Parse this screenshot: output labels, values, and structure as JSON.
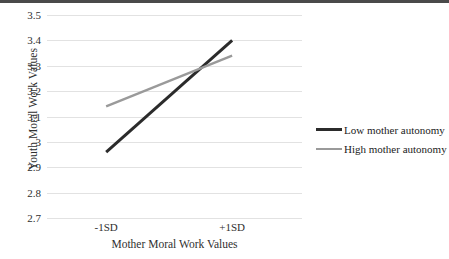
{
  "chart_data": {
    "type": "line",
    "title": "",
    "xlabel": "Mother Moral Work Values",
    "ylabel": "Youth Moral Work Values",
    "categories": [
      "-1SD",
      "+1SD"
    ],
    "x": [
      0,
      1
    ],
    "ylim": [
      2.7,
      3.5
    ],
    "ytick_labels": [
      "3.5",
      "3.4",
      "3.3",
      "3.2",
      "3.1",
      "3",
      "2.9",
      "2.8",
      "2.7"
    ],
    "ytick_values": [
      3.5,
      3.4,
      3.3,
      3.2,
      3.1,
      3.0,
      2.9,
      2.8,
      2.7
    ],
    "grid": "horizontal",
    "legend_position": "right",
    "series": [
      {
        "name": "Low mother autonomy",
        "values": [
          2.96,
          3.4
        ],
        "color": "#2b2b2b",
        "width": 3.0
      },
      {
        "name": "High mother autonomy",
        "values": [
          3.14,
          3.34
        ],
        "color": "#9a9a9a",
        "width": 2.4
      }
    ]
  },
  "axes": {
    "y_title": "Youth Moral Work Values",
    "x_title": "Mother Moral Work Values"
  },
  "colors": {
    "gridline": "#e2e2e2",
    "text": "#2f2f2f",
    "series_low": "#2b2b2b",
    "series_high": "#9a9a9a",
    "top_border": "#4a4a4a"
  },
  "legend": {
    "items": [
      {
        "label": "Low mother autonomy",
        "color": "#2b2b2b"
      },
      {
        "label": "High mother autonomy",
        "color": "#9a9a9a"
      }
    ]
  }
}
